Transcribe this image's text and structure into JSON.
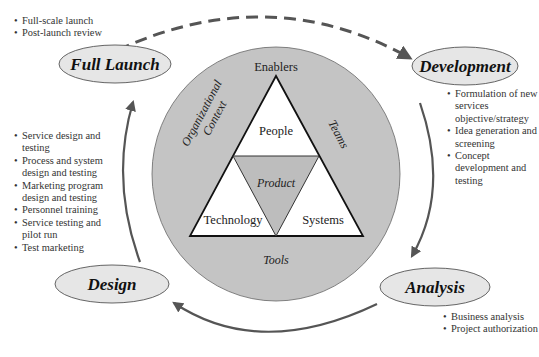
{
  "diagram": {
    "type": "new-service-development-cycle",
    "colors": {
      "circle_fill": "#c4c4c4",
      "ellipse_fill": "#e6e6e6",
      "arrow": "#555555",
      "triangle_center_fill": "#bdbdbd",
      "triangle_outer_fill": "#ffffff"
    },
    "stages": [
      {
        "id": "full-launch",
        "label": "Full Launch"
      },
      {
        "id": "development",
        "label": "Development"
      },
      {
        "id": "analysis",
        "label": "Analysis"
      },
      {
        "id": "design",
        "label": "Design"
      }
    ],
    "center": {
      "top_label": "Enablers",
      "left_label_line1": "Organizational",
      "left_label_line2": "Context",
      "right_label": "Teams",
      "bottom_label": "Tools",
      "triangle": {
        "top": "People",
        "center": "Product",
        "bottom_left": "Technology",
        "bottom_right": "Systems"
      }
    },
    "bullets": {
      "full_launch": [
        "Full-scale launch",
        "Post-launch review"
      ],
      "development": [
        "Formulation of new services objective/strategy",
        "Idea generation and screening",
        "Concept development and testing"
      ],
      "analysis": [
        "Business analysis",
        "Project authorization"
      ],
      "design": [
        "Service design and testing",
        "Process and system design and testing",
        "Marketing program design and testing",
        "Personnel training",
        "Service testing and pilot run",
        "Test marketing"
      ]
    },
    "arrows": [
      {
        "from": "Full Launch",
        "to": "Development",
        "style": "dashed"
      },
      {
        "from": "Development",
        "to": "Analysis",
        "style": "solid"
      },
      {
        "from": "Analysis",
        "to": "Design",
        "style": "solid"
      },
      {
        "from": "Design",
        "to": "Full Launch",
        "style": "solid"
      }
    ]
  }
}
